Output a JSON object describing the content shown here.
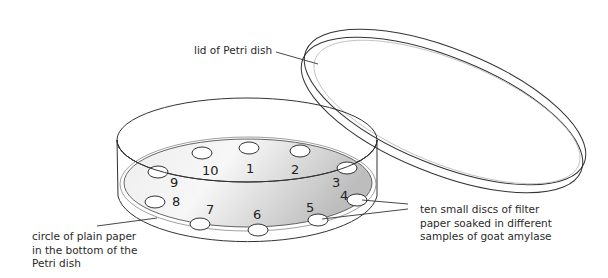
{
  "labels": {
    "lid": "lid of Petri dish",
    "paper": [
      "circle of plain paper",
      "in the bottom of the",
      "Petri dish"
    ],
    "discs": [
      "ten small discs of filter",
      "paper soaked in different",
      "samples of goat amylase"
    ]
  },
  "disc_numbers": [
    "1",
    "2",
    "3",
    "4",
    "5",
    "6",
    "7",
    "8",
    "9",
    "10"
  ],
  "colors": {
    "stroke": "#333333",
    "paper_light": "#f4f4f4",
    "paper_dark": "#c8c8c8"
  }
}
